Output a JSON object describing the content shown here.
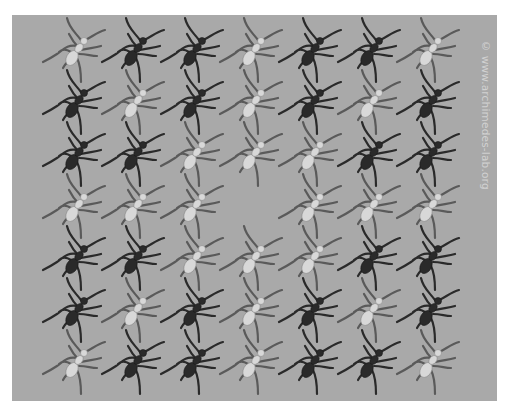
{
  "image": {
    "description": "Tessellated grid of ants on a gray background; each ant rendered either dark or light",
    "background_color": "#a9a9a9",
    "dark_ant_color": "#2a2a2a",
    "light_ant_color": "#d8d8d8",
    "grid": {
      "rows": 7,
      "cols": 7,
      "pattern": [
        [
          "L",
          "D",
          "D",
          "L",
          "D",
          "D",
          "L"
        ],
        [
          "D",
          "L",
          "D",
          "L",
          "D",
          "L",
          "D"
        ],
        [
          "D",
          "D",
          "L",
          "L",
          "L",
          "D",
          "D"
        ],
        [
          "L",
          "L",
          "L",
          "_",
          "L",
          "L",
          "L"
        ],
        [
          "D",
          "D",
          "L",
          "L",
          "L",
          "D",
          "D"
        ],
        [
          "D",
          "L",
          "D",
          "L",
          "D",
          "L",
          "D"
        ],
        [
          "L",
          "D",
          "D",
          "L",
          "D",
          "D",
          "L"
        ]
      ],
      "legend": {
        "D": "dark ant",
        "L": "light ant",
        "_": "empty"
      }
    },
    "watermark": "© www.archimedes-lab.org"
  }
}
